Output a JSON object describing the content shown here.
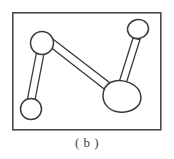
{
  "figure": {
    "caption": "( b )",
    "panel_label": "b",
    "frame": {
      "x": 12,
      "y": 12,
      "width": 149,
      "height": 118,
      "stroke_color": "#4a4a4a"
    },
    "style": {
      "background_color": "#ffffff",
      "line_color": "#3a3a3a",
      "fill_color": "#ffffff"
    },
    "nodes": [
      {
        "id": "node-top-left",
        "name": "top-left-circle",
        "shape": "circle",
        "cx": 42,
        "cy": 43,
        "r": 11.5
      },
      {
        "id": "node-bottom-left",
        "name": "bottom-left-circle",
        "shape": "circle",
        "cx": 31,
        "cy": 109,
        "r": 10.5
      },
      {
        "id": "node-top-right",
        "name": "top-right-circle",
        "shape": "ellipse",
        "cx": 138,
        "cy": 29,
        "rx": 10.5,
        "ry": 9.5
      },
      {
        "id": "node-bottom-right",
        "name": "bottom-right-blob",
        "shape": "blob",
        "cx": 122,
        "cy": 96,
        "rx": 19,
        "ry": 16
      }
    ],
    "links": [
      {
        "id": "link-left",
        "name": "left-vertical-bar",
        "from": "node-top-left",
        "to": "node-bottom-left",
        "style": "double-line"
      },
      {
        "id": "link-middle",
        "name": "middle-diagonal-bar",
        "from": "node-top-left",
        "to": "node-bottom-right",
        "style": "double-line"
      },
      {
        "id": "link-right",
        "name": "right-diagonal-bar",
        "from": "node-top-right",
        "to": "node-bottom-right",
        "style": "double-line"
      }
    ]
  }
}
